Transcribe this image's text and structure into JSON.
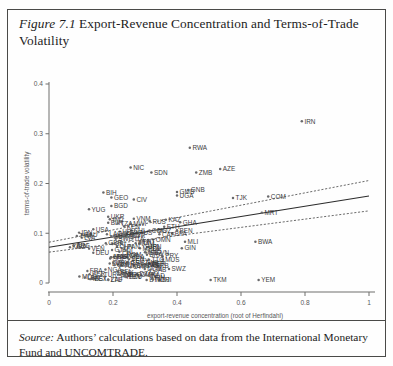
{
  "figure": {
    "number": "Figure 7.1",
    "title": "Export-Revenue Concentration and Terms-of-Trade Volatility"
  },
  "source": {
    "label": "Source:",
    "text": " Authors’ calculations based on data from the International Monetary Fund and UNCOMTRADE."
  },
  "chart_data": {
    "type": "scatter",
    "title": "Export-Revenue Concentration and Terms-of-Trade Volatility",
    "xlabel": "export-revenue concentration (root of Herfindahl)",
    "ylabel": "terms-of-trade volatility",
    "xlim": [
      0,
      1.06
    ],
    "ylim": [
      0,
      0.42
    ],
    "xticks": [
      0,
      0.2,
      0.4,
      0.6,
      0.8,
      1
    ],
    "xticklabels": [
      "0",
      "0.2",
      "0.4",
      "0.6",
      "0.8",
      "1"
    ],
    "yticks": [
      0,
      0.1,
      0.2,
      0.3,
      0.4
    ],
    "yticklabels": [
      "0",
      "0.1",
      "0.2",
      "0.3",
      "0.4"
    ],
    "grid": false,
    "legend": false,
    "fit_line": {
      "label": "linear fit",
      "x": [
        0.0,
        1.0
      ],
      "y": [
        0.072,
        0.175
      ]
    },
    "confidence_upper": {
      "label": "upper confidence band",
      "x": [
        0.0,
        1.0
      ],
      "y": [
        0.082,
        0.206
      ]
    },
    "confidence_lower": {
      "label": "lower confidence band",
      "x": [
        0.0,
        1.0
      ],
      "y": [
        0.062,
        0.145
      ]
    },
    "points": [
      {
        "label": "IRN",
        "x": 0.79,
        "y": 0.325
      },
      {
        "label": "RWA",
        "x": 0.44,
        "y": 0.272
      },
      {
        "label": "NIC",
        "x": 0.255,
        "y": 0.232
      },
      {
        "label": "SDN",
        "x": 0.32,
        "y": 0.222
      },
      {
        "label": "ZMB",
        "x": 0.46,
        "y": 0.222
      },
      {
        "label": "AZE",
        "x": 0.535,
        "y": 0.229
      },
      {
        "label": "BIH",
        "x": 0.17,
        "y": 0.182
      },
      {
        "label": "GEO",
        "x": 0.195,
        "y": 0.172
      },
      {
        "label": "CIV",
        "x": 0.265,
        "y": 0.168
      },
      {
        "label": "BGD",
        "x": 0.195,
        "y": 0.155
      },
      {
        "label": "GMB",
        "x": 0.4,
        "y": 0.183
      },
      {
        "label": "UGA",
        "x": 0.4,
        "y": 0.176
      },
      {
        "label": "GNB",
        "x": 0.435,
        "y": 0.187
      },
      {
        "label": "TJK",
        "x": 0.575,
        "y": 0.171
      },
      {
        "label": "COM",
        "x": 0.685,
        "y": 0.174
      },
      {
        "label": "YUG",
        "x": 0.125,
        "y": 0.148
      },
      {
        "label": "MRT",
        "x": 0.665,
        "y": 0.141
      },
      {
        "label": "UKR",
        "x": 0.185,
        "y": 0.133
      },
      {
        "label": "IND",
        "x": 0.19,
        "y": 0.128
      },
      {
        "label": "VNM",
        "x": 0.265,
        "y": 0.129
      },
      {
        "label": "BLR",
        "x": 0.185,
        "y": 0.121
      },
      {
        "label": "TZA",
        "x": 0.215,
        "y": 0.12
      },
      {
        "label": "RUS",
        "x": 0.315,
        "y": 0.124
      },
      {
        "label": "MWI",
        "x": 0.255,
        "y": 0.119
      },
      {
        "label": "KAZ",
        "x": 0.365,
        "y": 0.127
      },
      {
        "label": "GHA",
        "x": 0.41,
        "y": 0.122
      },
      {
        "label": "KEN",
        "x": 0.235,
        "y": 0.114
      },
      {
        "label": "ETH",
        "x": 0.36,
        "y": 0.113
      },
      {
        "label": "MOZ",
        "x": 0.33,
        "y": 0.106
      },
      {
        "label": "BEN",
        "x": 0.4,
        "y": 0.106
      },
      {
        "label": "BFA",
        "x": 0.385,
        "y": 0.1
      },
      {
        "label": "CAF",
        "x": 0.345,
        "y": 0.098
      },
      {
        "label": "MLI",
        "x": 0.425,
        "y": 0.083
      },
      {
        "label": "BWA",
        "x": 0.645,
        "y": 0.083
      },
      {
        "label": "GIN",
        "x": 0.415,
        "y": 0.07
      },
      {
        "label": "PHL",
        "x": 0.22,
        "y": 0.063
      },
      {
        "label": "HND",
        "x": 0.3,
        "y": 0.062
      },
      {
        "label": "MAR",
        "x": 0.195,
        "y": 0.052
      },
      {
        "label": "MDA",
        "x": 0.245,
        "y": 0.052
      },
      {
        "label": "PRY",
        "x": 0.355,
        "y": 0.054
      },
      {
        "label": "MUS",
        "x": 0.355,
        "y": 0.047
      },
      {
        "label": "TUN",
        "x": 0.225,
        "y": 0.035
      },
      {
        "label": "BHR",
        "x": 0.265,
        "y": 0.035
      },
      {
        "label": "BRB",
        "x": 0.325,
        "y": 0.035
      },
      {
        "label": "SWZ",
        "x": 0.375,
        "y": 0.028
      },
      {
        "label": "MDG",
        "x": 0.095,
        "y": 0.013
      },
      {
        "label": "BTN",
        "x": 0.305,
        "y": 0.006
      },
      {
        "label": "DJI",
        "x": 0.345,
        "y": 0.006
      },
      {
        "label": "TKM",
        "x": 0.505,
        "y": 0.006
      },
      {
        "label": "YEM",
        "x": 0.655,
        "y": 0.006
      }
    ],
    "cluster_labels": [
      "ARG",
      "AUS",
      "AUT",
      "BEL",
      "BOL",
      "BRA",
      "CAN",
      "CHE",
      "CHL",
      "CHN",
      "CMR",
      "COG",
      "COL",
      "CRI",
      "CYP",
      "CZE",
      "DEU",
      "DNK",
      "DOM",
      "DZA",
      "ECU",
      "EGY",
      "ESP",
      "EST",
      "FIN",
      "FJI",
      "FRA",
      "GAB",
      "GBR",
      "GRC",
      "GTM",
      "HKG",
      "HRV",
      "HUN",
      "IDN",
      "IRL",
      "ISL",
      "ISR",
      "ITA",
      "JAM",
      "JOR",
      "JPN",
      "KGZ",
      "KOR",
      "LAO",
      "LBN",
      "LKA",
      "LTU",
      "LVA",
      "MEX",
      "MKD",
      "MLT",
      "MYS",
      "NER",
      "NGA",
      "NLD",
      "NOR",
      "NPL",
      "NZL",
      "OMN",
      "PAK",
      "PAN",
      "PER",
      "POL",
      "PRT",
      "ROM",
      "SAU",
      "SEN",
      "SGP",
      "SLV",
      "SVK",
      "SVN",
      "SWE",
      "SYR",
      "THA",
      "TGO",
      "TTO",
      "TUR",
      "URY",
      "USA",
      "VEN",
      "ZAF",
      "ZWE"
    ]
  }
}
